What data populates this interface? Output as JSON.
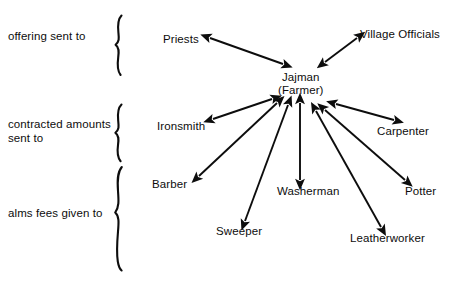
{
  "diagram": {
    "width": 451,
    "height": 281,
    "background_color": "#ffffff",
    "ink_color": "#0d0d0d"
  },
  "hub": {
    "name_line1": "Jajman",
    "name_line2": "(Farmer)",
    "x": 278,
    "y": 71
  },
  "group_labels": [
    {
      "id": "offering",
      "text": "offering sent to",
      "x": 8,
      "y": 30
    },
    {
      "id": "contracted",
      "line1": "contracted amounts",
      "line2": "sent to",
      "x": 8,
      "y": 118
    },
    {
      "id": "alms",
      "text": "alms fees given to",
      "x": 8,
      "y": 207
    }
  ],
  "braces": [
    {
      "id": "brace-offering",
      "top": 14,
      "bottom": 76,
      "x": 116
    },
    {
      "id": "brace-contracted",
      "top": 103,
      "bottom": 162,
      "x": 116
    },
    {
      "id": "brace-alms",
      "top": 166,
      "bottom": 271,
      "x": 116
    }
  ],
  "nodes": [
    {
      "id": "priests",
      "label": "Priests",
      "x": 163,
      "y": 33,
      "group": "offering"
    },
    {
      "id": "village-officials",
      "label": "Village Officials",
      "x": 360,
      "y": 28,
      "group": "offering"
    },
    {
      "id": "ironsmith",
      "label": "Ironsmith",
      "x": 157,
      "y": 120,
      "group": "contracted"
    },
    {
      "id": "carpenter",
      "label": "Carpenter",
      "x": 377,
      "y": 125,
      "group": "contracted"
    },
    {
      "id": "barber",
      "label": "Barber",
      "x": 152,
      "y": 178,
      "group": "contracted"
    },
    {
      "id": "washerman",
      "label": "Washerman",
      "x": 277,
      "y": 185,
      "group": "alms"
    },
    {
      "id": "potter",
      "label": "Potter",
      "x": 405,
      "y": 185,
      "group": "alms"
    },
    {
      "id": "sweeper",
      "label": "Sweeper",
      "x": 216,
      "y": 225,
      "group": "alms"
    },
    {
      "id": "leatherworker",
      "label": "Leatherworker",
      "x": 350,
      "y": 232,
      "group": "alms"
    }
  ],
  "connections": [
    {
      "id": "hub-priests",
      "from": "jajman",
      "to": "priests",
      "style": "double-headed-arrow",
      "x1": 283,
      "y1": 64,
      "x2": 210,
      "y2": 38
    },
    {
      "id": "hub-village-officials",
      "from": "jajman",
      "to": "village-officials",
      "style": "double-headed-arrow",
      "x1": 325,
      "y1": 62,
      "x2": 357,
      "y2": 38
    },
    {
      "id": "hub-ironsmith",
      "from": "jajman",
      "to": "ironsmith",
      "style": "double-headed-arrow",
      "x1": 272,
      "y1": 99,
      "x2": 213,
      "y2": 119
    },
    {
      "id": "hub-carpenter",
      "from": "jajman",
      "to": "carpenter",
      "style": "double-headed-arrow",
      "x1": 336,
      "y1": 104,
      "x2": 394,
      "y2": 120
    },
    {
      "id": "hub-barber",
      "from": "jajman",
      "to": "barber",
      "style": "double-headed-arrow",
      "x1": 277,
      "y1": 103,
      "x2": 199,
      "y2": 176
    },
    {
      "id": "hub-washerman",
      "from": "jajman",
      "to": "washerman",
      "style": "double-headed-arrow",
      "x1": 300,
      "y1": 103,
      "x2": 300,
      "y2": 180
    },
    {
      "id": "hub-potter",
      "from": "jajman",
      "to": "potter",
      "style": "double-headed-arrow",
      "x1": 325,
      "y1": 110,
      "x2": 405,
      "y2": 180
    },
    {
      "id": "hub-sweeper",
      "from": "jajman",
      "to": "sweeper",
      "style": "double-headed-arrow",
      "x1": 288,
      "y1": 105,
      "x2": 245,
      "y2": 221
    },
    {
      "id": "hub-leatherworker",
      "from": "jajman",
      "to": "leatherworker",
      "style": "double-headed-arrow",
      "x1": 316,
      "y1": 111,
      "x2": 381,
      "y2": 227
    }
  ]
}
